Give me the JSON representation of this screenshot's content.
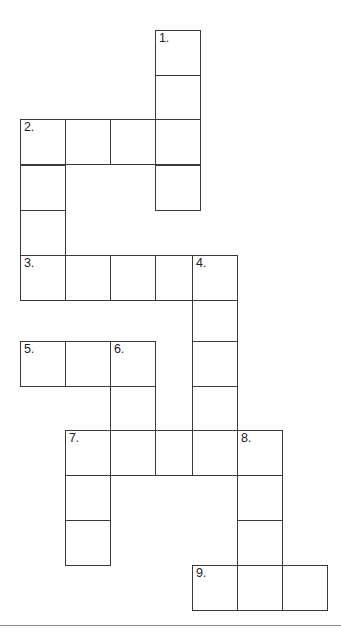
{
  "document": {
    "type": "crossword-puzzle-grid",
    "title": "",
    "background_color": "#ffffff",
    "grid_line_color": "#3a3a3a",
    "number_text_color": "#232323",
    "footer_rule_color": "#8a8a8a"
  },
  "grid": {
    "origin_x": 20,
    "origin_y": 30,
    "cell_size": 45,
    "columns": 7,
    "rows": 14,
    "column_x": [
      20,
      65,
      110,
      155,
      192,
      237,
      282
    ],
    "row_y": [
      30,
      75,
      119,
      165,
      210,
      255,
      300,
      341,
      386,
      430,
      475,
      520,
      565,
      610
    ]
  },
  "clue_numbers": [
    {
      "number": "1.",
      "col": 3,
      "row": 0
    },
    {
      "number": "2.",
      "col": 0,
      "row": 2
    },
    {
      "number": "3.",
      "col": 0,
      "row": 5
    },
    {
      "number": "4.",
      "col": 4,
      "row": 5
    },
    {
      "number": "5.",
      "col": 0,
      "row": 7
    },
    {
      "number": "6.",
      "col": 2,
      "row": 7
    },
    {
      "number": "7.",
      "col": 1,
      "row": 9
    },
    {
      "number": "8.",
      "col": 5,
      "row": 9
    },
    {
      "number": "9.",
      "col": 4,
      "row": 12
    }
  ],
  "cells": [
    {
      "col": 3,
      "row": 0,
      "number": "1.",
      "letter": ""
    },
    {
      "col": 3,
      "row": 1,
      "number": "",
      "letter": ""
    },
    {
      "col": 0,
      "row": 2,
      "number": "2.",
      "letter": ""
    },
    {
      "col": 1,
      "row": 2,
      "number": "",
      "letter": ""
    },
    {
      "col": 2,
      "row": 2,
      "number": "",
      "letter": ""
    },
    {
      "col": 3,
      "row": 2,
      "number": "",
      "letter": ""
    },
    {
      "col": 0,
      "row": 3,
      "number": "",
      "letter": ""
    },
    {
      "col": 3,
      "row": 3,
      "number": "",
      "letter": ""
    },
    {
      "col": 0,
      "row": 4,
      "number": "",
      "letter": ""
    },
    {
      "col": 0,
      "row": 5,
      "number": "3.",
      "letter": ""
    },
    {
      "col": 1,
      "row": 5,
      "number": "",
      "letter": ""
    },
    {
      "col": 2,
      "row": 5,
      "number": "",
      "letter": ""
    },
    {
      "col": 3,
      "row": 5,
      "number": "",
      "letter": ""
    },
    {
      "col": 4,
      "row": 5,
      "number": "4.",
      "letter": ""
    },
    {
      "col": 4,
      "row": 6,
      "number": "",
      "letter": ""
    },
    {
      "col": 0,
      "row": 7,
      "number": "5.",
      "letter": ""
    },
    {
      "col": 1,
      "row": 7,
      "number": "",
      "letter": ""
    },
    {
      "col": 2,
      "row": 7,
      "number": "6.",
      "letter": ""
    },
    {
      "col": 4,
      "row": 7,
      "number": "",
      "letter": ""
    },
    {
      "col": 2,
      "row": 8,
      "number": "",
      "letter": ""
    },
    {
      "col": 4,
      "row": 8,
      "number": "",
      "letter": ""
    },
    {
      "col": 1,
      "row": 9,
      "number": "7.",
      "letter": ""
    },
    {
      "col": 2,
      "row": 9,
      "number": "",
      "letter": ""
    },
    {
      "col": 3,
      "row": 9,
      "number": "",
      "letter": ""
    },
    {
      "col": 4,
      "row": 9,
      "number": "",
      "letter": ""
    },
    {
      "col": 5,
      "row": 9,
      "number": "8.",
      "letter": ""
    },
    {
      "col": 1,
      "row": 10,
      "number": "",
      "letter": ""
    },
    {
      "col": 5,
      "row": 10,
      "number": "",
      "letter": ""
    },
    {
      "col": 1,
      "row": 11,
      "number": "",
      "letter": ""
    },
    {
      "col": 5,
      "row": 11,
      "number": "",
      "letter": ""
    },
    {
      "col": 4,
      "row": 12,
      "number": "9.",
      "letter": ""
    },
    {
      "col": 5,
      "row": 12,
      "number": "",
      "letter": ""
    },
    {
      "col": 6,
      "row": 12,
      "number": "",
      "letter": ""
    }
  ],
  "footer_rule": {
    "y": 625
  }
}
